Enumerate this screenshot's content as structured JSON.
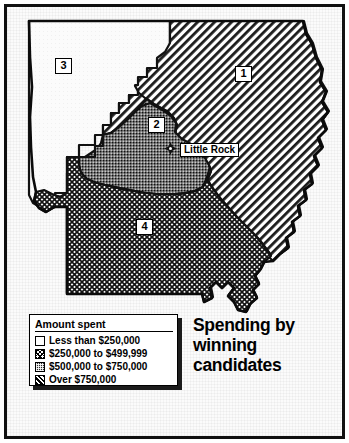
{
  "title": {
    "line1": "Spending by",
    "line2": "winning",
    "line3": "candidates",
    "full": "Spending by winning candidates"
  },
  "legend": {
    "heading": "Amount spent",
    "items": [
      {
        "pattern": "none",
        "label": "Less than $250,000"
      },
      {
        "pattern": "cross",
        "label": "$250,000 to $499,999"
      },
      {
        "pattern": "dots",
        "label": "$500,000 to $750,000"
      },
      {
        "pattern": "diag",
        "label": "Over $750,000"
      }
    ]
  },
  "map": {
    "city": {
      "name": "Little Rock",
      "marker": "city-diamond-icon"
    },
    "districts": [
      {
        "id": "1",
        "label": "1",
        "pattern": "diag",
        "amount_band": "Over $750,000"
      },
      {
        "id": "2",
        "label": "2",
        "pattern": "dots",
        "amount_band": "$500,000 to $750,000"
      },
      {
        "id": "3",
        "label": "3",
        "pattern": "none",
        "amount_band": "Less than $250,000"
      },
      {
        "id": "4",
        "label": "4",
        "pattern": "cross",
        "amount_band": "$250,000 to $499,999"
      }
    ]
  },
  "colors": {
    "ink": "#000000",
    "paper": "#ffffff",
    "frame": "#111111",
    "district2_fill": "#6f6f6f",
    "district4_fill": "#8a8a8a"
  }
}
